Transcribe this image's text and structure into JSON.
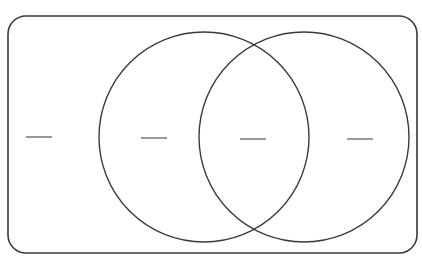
{
  "diagram": {
    "type": "venn",
    "universe": {
      "label": "",
      "blank_label": "___",
      "x": 8,
      "y": 16,
      "width": 409,
      "height": 237,
      "corner_radius": 18
    },
    "sets": [
      {
        "name": "Set A",
        "cx": 204,
        "cy": 137,
        "r": 105
      },
      {
        "name": "Set B",
        "cx": 304,
        "cy": 137,
        "r": 105
      }
    ],
    "blanks": [
      {
        "region": "outside",
        "x1": 26,
        "x2": 52,
        "y": 137,
        "text": ""
      },
      {
        "region": "A-only",
        "x1": 141,
        "x2": 167,
        "y": 138,
        "text": ""
      },
      {
        "region": "A-and-B",
        "x1": 240,
        "x2": 266,
        "y": 139,
        "text": ""
      },
      {
        "region": "B-only",
        "x1": 347,
        "x2": 373,
        "y": 139,
        "text": ""
      }
    ],
    "colors": {
      "stroke": "#3a3a3a",
      "blank_line": "#555555",
      "background": "#ffffff"
    }
  }
}
